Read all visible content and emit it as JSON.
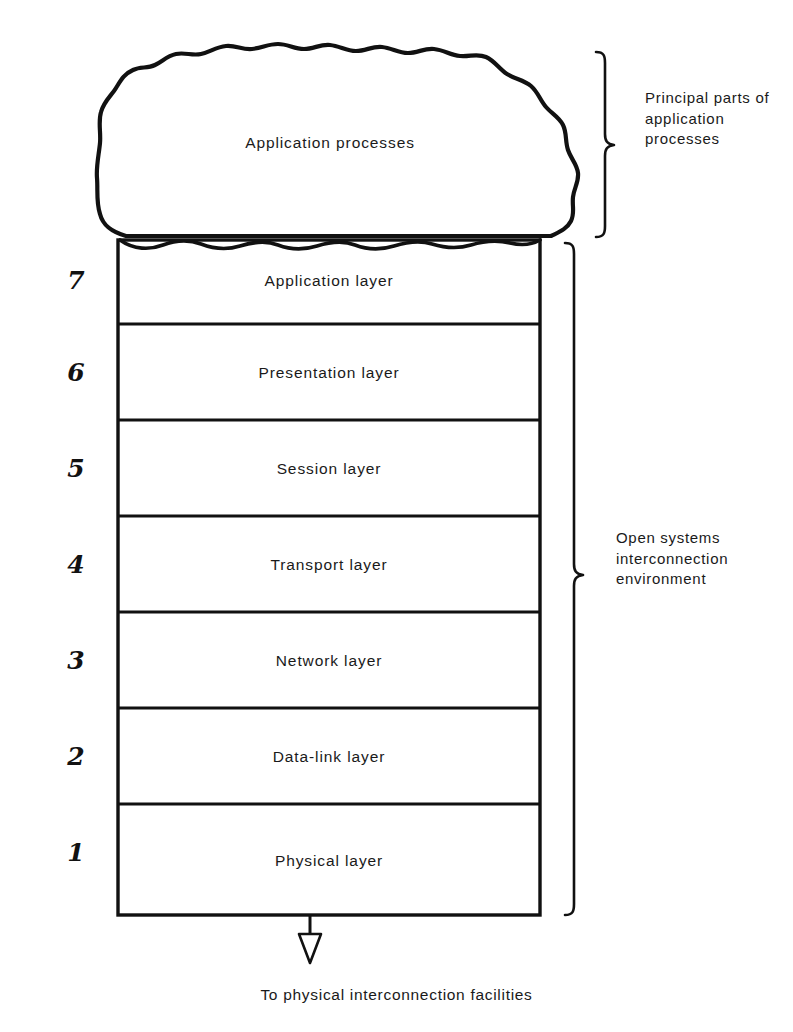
{
  "diagram": {
    "blob": {
      "label": "Application processes",
      "shape_name": "hand-drawn-cloud"
    },
    "layers": [
      {
        "number": "7",
        "label": "Application layer"
      },
      {
        "number": "6",
        "label": "Presentation layer"
      },
      {
        "number": "5",
        "label": "Session layer"
      },
      {
        "number": "4",
        "label": "Transport layer"
      },
      {
        "number": "3",
        "label": "Network layer"
      },
      {
        "number": "2",
        "label": "Data-link layer"
      },
      {
        "number": "1",
        "label": "Physical layer"
      }
    ],
    "annotations": {
      "top_brace_label": "Principal\nparts of\napplication\nprocesses",
      "bottom_brace_label": "Open systems\ninterconnection\nenvironment"
    },
    "arrow": {
      "caption": "To physical interconnection facilities",
      "direction": "down",
      "style": "hollow-triangle-head"
    },
    "colors": {
      "ink": "#1b1b1b",
      "background": "#ffffff"
    }
  }
}
